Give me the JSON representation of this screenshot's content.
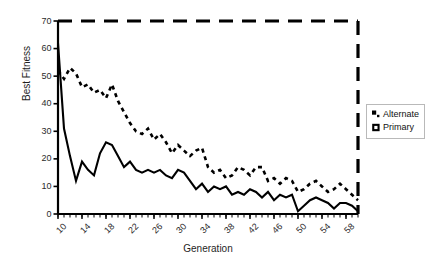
{
  "chart_data": {
    "type": "line",
    "title": "",
    "xlabel": "Generation",
    "ylabel": "Best Fitness",
    "xlim": [
      10,
      60
    ],
    "ylim": [
      0,
      70
    ],
    "xtick_labels": [
      "10",
      "14",
      "18",
      "22",
      "26",
      "30",
      "34",
      "38",
      "42",
      "46",
      "50",
      "54",
      "58"
    ],
    "xtick_values": [
      10,
      14,
      18,
      22,
      26,
      30,
      34,
      38,
      42,
      46,
      50,
      54,
      58
    ],
    "xtick_minor_step": 1,
    "ytick_labels": [
      "0",
      "10",
      "20",
      "30",
      "40",
      "50",
      "60",
      "70"
    ],
    "ytick_values": [
      0,
      10,
      20,
      30,
      40,
      50,
      60,
      70
    ],
    "grid": false,
    "legend_position": "right",
    "frame_top_style": "dashed",
    "frame_right_style": "dashed",
    "x": [
      10,
      11,
      12,
      13,
      14,
      15,
      16,
      17,
      18,
      19,
      20,
      21,
      22,
      23,
      24,
      25,
      26,
      27,
      28,
      29,
      30,
      31,
      32,
      33,
      34,
      35,
      36,
      37,
      38,
      39,
      40,
      41,
      42,
      43,
      44,
      45,
      46,
      47,
      48,
      49,
      50,
      51,
      52,
      53,
      54,
      55,
      56,
      57,
      58,
      59,
      60
    ],
    "series": [
      {
        "name": "Alternate",
        "style": "dashed",
        "marker": "small-filled-square",
        "color": "#000000",
        "values": [
          52,
          49,
          53,
          51,
          46,
          47,
          44,
          45,
          42,
          47,
          41,
          37,
          33,
          30,
          29,
          31,
          27,
          29,
          26,
          22,
          25,
          23,
          21,
          23,
          24,
          17,
          15,
          16,
          13,
          14,
          17,
          16,
          14,
          17,
          17,
          12,
          13,
          11,
          13,
          12,
          8,
          9,
          11,
          12,
          10,
          8,
          9,
          11,
          9,
          7,
          5
        ]
      },
      {
        "name": "Primary",
        "style": "solid",
        "marker": "open-square",
        "color": "#000000",
        "values": [
          62,
          31,
          21,
          12,
          19,
          16,
          14,
          22,
          26,
          25,
          21,
          17,
          19,
          16,
          15,
          16,
          15,
          16,
          14,
          13,
          16,
          15,
          12,
          9,
          11,
          8,
          10,
          9,
          10,
          7,
          8,
          7,
          9,
          8,
          6,
          8,
          5,
          7,
          6,
          7,
          1,
          3,
          5,
          6,
          5,
          4,
          2,
          4,
          4,
          3,
          1
        ]
      }
    ]
  },
  "legend": {
    "items": [
      {
        "label": "Alternate",
        "marker": "small-filled-square"
      },
      {
        "label": "Primary",
        "marker": "open-square"
      }
    ]
  }
}
